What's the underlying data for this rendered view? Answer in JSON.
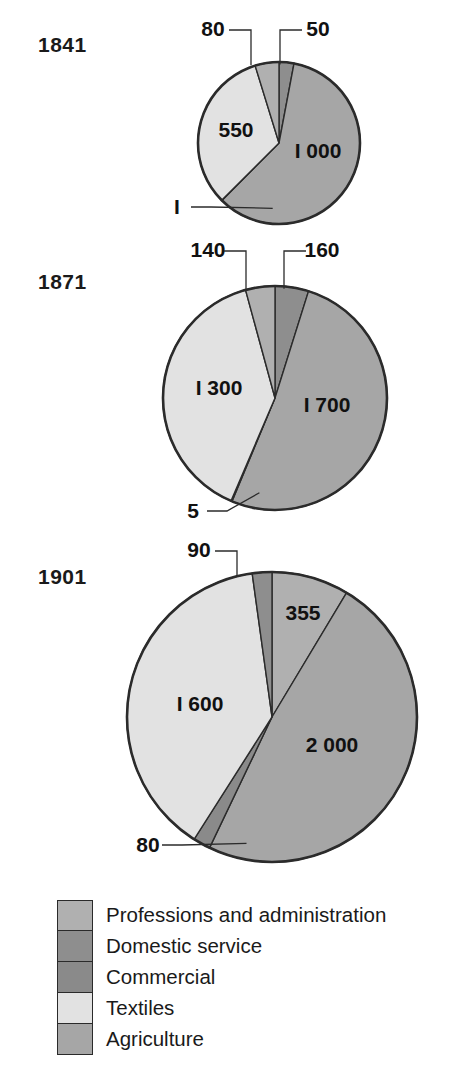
{
  "figure": {
    "background_color": "#ffffff",
    "outline_color": "#2b2b2b"
  },
  "legend": {
    "position": "bottom-left",
    "items": [
      {
        "label": "Professions and administration",
        "color": "#b0b0b0",
        "swatch_name": "legend-swatch-professions"
      },
      {
        "label": "Domestic service",
        "color": "#8e8e8e",
        "swatch_name": "legend-swatch-domestic-service"
      },
      {
        "label": "Commercial",
        "color": "#8a8a8a",
        "swatch_name": "legend-swatch-commercial"
      },
      {
        "label": "Textiles",
        "color": "#e2e2e2",
        "swatch_name": "legend-swatch-textiles"
      },
      {
        "label": "Agriculture",
        "color": "#a6a6a6",
        "swatch_name": "legend-swatch-agriculture"
      }
    ]
  },
  "charts": [
    {
      "year": "1841",
      "year_label_x": 38,
      "year_label_y": 33,
      "center_x": 279,
      "center_y": 143,
      "radius": 81,
      "total": 1681,
      "slices": [
        {
          "category": "Agriculture",
          "value": 1000,
          "label": "I 000",
          "color": "#a6a6a6",
          "inside": true,
          "label_x": 318,
          "label_y": 158
        },
        {
          "category": "Textiles",
          "value": 550,
          "label": "550",
          "color": "#e2e2e2",
          "inside": true,
          "label_x": 236,
          "label_y": 137
        },
        {
          "category": "Professions and administration",
          "value": 80,
          "label": "80",
          "color": "#b0b0b0",
          "inside": false,
          "label_x": 213,
          "label_y": 36
        },
        {
          "category": "Domestic service",
          "value": 50,
          "label": "50",
          "color": "#8e8e8e",
          "inside": false,
          "label_x": 318,
          "label_y": 36
        },
        {
          "category": "Commercial",
          "value": 1,
          "label": "I",
          "color": "#8a8a8a",
          "inside": false,
          "label_x": 177,
          "label_y": 214
        }
      ]
    },
    {
      "year": "1871",
      "year_label_x": 38,
      "year_label_y": 270,
      "center_x": 275,
      "center_y": 398,
      "radius": 112,
      "total": 3305,
      "slices": [
        {
          "category": "Agriculture",
          "value": 1700,
          "label": "I 700",
          "color": "#a6a6a6",
          "inside": true,
          "label_x": 327,
          "label_y": 412
        },
        {
          "category": "Textiles",
          "value": 1300,
          "label": "I 300",
          "color": "#e2e2e2",
          "inside": true,
          "label_x": 219,
          "label_y": 395
        },
        {
          "category": "Professions and administration",
          "value": 140,
          "label": "140",
          "color": "#b0b0b0",
          "inside": false,
          "label_x": 208,
          "label_y": 257
        },
        {
          "category": "Domestic service",
          "value": 160,
          "label": "160",
          "color": "#8e8e8e",
          "inside": false,
          "label_x": 322,
          "label_y": 257
        },
        {
          "category": "Commercial",
          "value": 5,
          "label": "5",
          "color": "#8a8a8a",
          "inside": false,
          "label_x": 193,
          "label_y": 518
        }
      ]
    },
    {
      "year": "1901",
      "year_label_x": 38,
      "year_label_y": 565,
      "center_x": 272,
      "center_y": 717,
      "radius": 145,
      "total": 4125,
      "slices": [
        {
          "category": "Agriculture",
          "value": 2000,
          "label": "2 000",
          "color": "#a6a6a6",
          "inside": true,
          "label_x": 332,
          "label_y": 752
        },
        {
          "category": "Textiles",
          "value": 1600,
          "label": "I 600",
          "color": "#e2e2e2",
          "inside": true,
          "label_x": 200,
          "label_y": 711
        },
        {
          "category": "Professions and administration",
          "value": 355,
          "label": "355",
          "color": "#b0b0b0",
          "inside": true,
          "label_x": 303,
          "label_y": 620
        },
        {
          "category": "Domestic service",
          "value": 90,
          "label": "90",
          "color": "#8e8e8e",
          "inside": false,
          "label_x": 199,
          "label_y": 557
        },
        {
          "category": "Commercial",
          "value": 80,
          "label": "80",
          "color": "#8a8a8a",
          "inside": false,
          "label_x": 148,
          "label_y": 852
        }
      ]
    }
  ],
  "chart_data": {
    "type": "pie",
    "title": "",
    "subtitle": "",
    "xlabel": "",
    "ylabel": "",
    "grid": false,
    "legend_position": "bottom-left",
    "units": "thousands of workers",
    "categories": [
      "Professions and administration",
      "Domestic service",
      "Commercial",
      "Textiles",
      "Agriculture"
    ],
    "category_colors": [
      "#b0b0b0",
      "#8e8e8e",
      "#8a8a8a",
      "#e2e2e2",
      "#a6a6a6"
    ],
    "panels": [
      {
        "name": "1841",
        "total": 1681,
        "labels": [
          "80",
          "50",
          "I",
          "550",
          "I 000"
        ],
        "values": [
          80,
          50,
          1,
          550,
          1000
        ],
        "slices": [
          {
            "category": "Professions and administration",
            "value": 80,
            "label": "80"
          },
          {
            "category": "Domestic service",
            "value": 50,
            "label": "50"
          },
          {
            "category": "Commercial",
            "value": 1,
            "label": "I"
          },
          {
            "category": "Textiles",
            "value": 550,
            "label": "550"
          },
          {
            "category": "Agriculture",
            "value": 1000,
            "label": "I 000"
          }
        ]
      },
      {
        "name": "1871",
        "total": 3305,
        "labels": [
          "140",
          "160",
          "5",
          "I 300",
          "I 700"
        ],
        "values": [
          140,
          160,
          5,
          1300,
          1700
        ],
        "slices": [
          {
            "category": "Professions and administration",
            "value": 140,
            "label": "140"
          },
          {
            "category": "Domestic service",
            "value": 160,
            "label": "160"
          },
          {
            "category": "Commercial",
            "value": 5,
            "label": "5"
          },
          {
            "category": "Textiles",
            "value": 1300,
            "label": "I 300"
          },
          {
            "category": "Agriculture",
            "value": 1700,
            "label": "I 700"
          }
        ]
      },
      {
        "name": "1901",
        "total": 4125,
        "labels": [
          "90",
          "355",
          "80",
          "I 600",
          "2 000"
        ],
        "values": [
          355,
          90,
          80,
          1600,
          2000
        ],
        "slices": [
          {
            "category": "Professions and administration",
            "value": 355,
            "label": "355"
          },
          {
            "category": "Domestic service",
            "value": 90,
            "label": "90"
          },
          {
            "category": "Commercial",
            "value": 80,
            "label": "80"
          },
          {
            "category": "Textiles",
            "value": 1600,
            "label": "I 600"
          },
          {
            "category": "Agriculture",
            "value": 2000,
            "label": "2 000"
          }
        ]
      }
    ]
  }
}
